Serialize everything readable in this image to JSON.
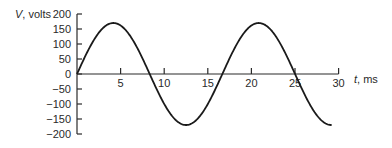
{
  "chart_data": {
    "type": "line",
    "title": "",
    "xlabel": "t, ms",
    "ylabel": "V, volts",
    "xlabel_var": "t",
    "xlabel_unit": ", ms",
    "ylabel_var": "V",
    "ylabel_unit": ", volts",
    "xlim": [
      0,
      30
    ],
    "ylim": [
      -200,
      200
    ],
    "x_ticks": [
      5,
      10,
      15,
      20,
      25,
      30
    ],
    "x_tick_labels": [
      "5",
      "10",
      "15",
      "20",
      "25",
      "30"
    ],
    "y_ticks": [
      200,
      150,
      100,
      50,
      0,
      -50,
      -100,
      -150,
      -200
    ],
    "y_tick_labels": [
      "200",
      "150",
      "100",
      "50",
      "0",
      "−50",
      "−100",
      "−150",
      "−200"
    ],
    "grid": false,
    "legend": null,
    "series": [
      {
        "name": "V(t)",
        "function": "170*sin(2*pi*60*t)",
        "amplitude_volts": 170,
        "frequency_hz": 60,
        "period_ms": 16.67,
        "t_start_ms": 0,
        "t_end_ms": 29.2,
        "x": [
          0,
          2.08,
          4.17,
          6.25,
          8.33,
          10.42,
          12.5,
          14.58,
          16.67,
          18.75,
          20.83,
          22.92,
          25.0,
          27.08,
          29.17
        ],
        "y": [
          0,
          120,
          170,
          120,
          0,
          -120,
          -170,
          -120,
          0,
          120,
          170,
          120,
          0,
          -120,
          -170
        ]
      }
    ]
  }
}
